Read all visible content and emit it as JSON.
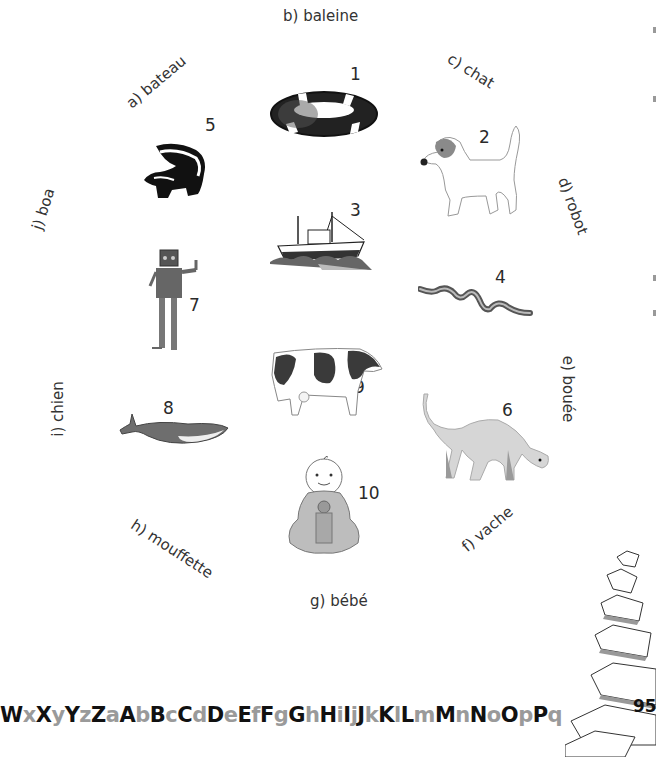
{
  "page": {
    "page_number": "95",
    "alphabet_strip": [
      {
        "c": "W",
        "case": "up"
      },
      {
        "c": "x",
        "case": "lo"
      },
      {
        "c": "X",
        "case": "up"
      },
      {
        "c": "y",
        "case": "lo"
      },
      {
        "c": "Y",
        "case": "up"
      },
      {
        "c": "z",
        "case": "lo"
      },
      {
        "c": "Z",
        "case": "up"
      },
      {
        "c": "a",
        "case": "lo"
      },
      {
        "c": "A",
        "case": "up"
      },
      {
        "c": "b",
        "case": "lo"
      },
      {
        "c": "B",
        "case": "up"
      },
      {
        "c": "c",
        "case": "lo"
      },
      {
        "c": "C",
        "case": "up"
      },
      {
        "c": "d",
        "case": "lo"
      },
      {
        "c": "D",
        "case": "up"
      },
      {
        "c": "e",
        "case": "lo"
      },
      {
        "c": "E",
        "case": "up"
      },
      {
        "c": "f",
        "case": "lo"
      },
      {
        "c": "F",
        "case": "up"
      },
      {
        "c": "g",
        "case": "lo"
      },
      {
        "c": "G",
        "case": "up"
      },
      {
        "c": "h",
        "case": "lo"
      },
      {
        "c": "H",
        "case": "up"
      },
      {
        "c": "i",
        "case": "lo"
      },
      {
        "c": "I",
        "case": "up"
      },
      {
        "c": "j",
        "case": "lo"
      },
      {
        "c": "J",
        "case": "up"
      },
      {
        "c": "k",
        "case": "lo"
      },
      {
        "c": "K",
        "case": "up"
      },
      {
        "c": "l",
        "case": "lo"
      },
      {
        "c": "L",
        "case": "up"
      },
      {
        "c": "m",
        "case": "lo"
      },
      {
        "c": "M",
        "case": "up"
      },
      {
        "c": "n",
        "case": "lo"
      },
      {
        "c": "N",
        "case": "up"
      },
      {
        "c": "o",
        "case": "lo"
      },
      {
        "c": "O",
        "case": "up"
      },
      {
        "c": "p",
        "case": "lo"
      },
      {
        "c": "P",
        "case": "up"
      },
      {
        "c": "q",
        "case": "lo"
      }
    ]
  },
  "words": {
    "a": "a) bateau",
    "b": "b) baleine",
    "c": "c) chat",
    "d": "d) robot",
    "e": "e) bouée",
    "f": "f) vache",
    "g": "g) bébé",
    "h": "h) mouffette",
    "i": "i) chien",
    "j": "j) boa"
  },
  "pictures": {
    "n1": {
      "number": "1",
      "subject": "lifebuoy"
    },
    "n2": {
      "number": "2",
      "subject": "dog"
    },
    "n3": {
      "number": "3",
      "subject": "ship"
    },
    "n4": {
      "number": "4",
      "subject": "snake"
    },
    "n5": {
      "number": "5",
      "subject": "skunk"
    },
    "n6": {
      "number": "6",
      "subject": "cat"
    },
    "n7": {
      "number": "7",
      "subject": "robot"
    },
    "n8": {
      "number": "8",
      "subject": "whale"
    },
    "n9": {
      "number": "9",
      "subject": "cow"
    },
    "n10": {
      "number": "10",
      "subject": "baby"
    }
  }
}
